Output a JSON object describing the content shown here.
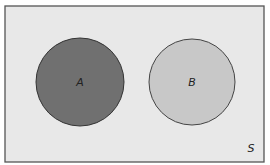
{
  "diagram": {
    "type": "venn",
    "universe": {
      "label": "S",
      "fill": "#e8e8e8",
      "stroke": "#555555"
    },
    "sets": [
      {
        "label": "A",
        "fill": "#707070",
        "stroke": "#333333",
        "overlap": false
      },
      {
        "label": "B",
        "fill": "#c8c8c8",
        "stroke": "#444444",
        "overlap": false
      }
    ],
    "relationship": "disjoint"
  }
}
